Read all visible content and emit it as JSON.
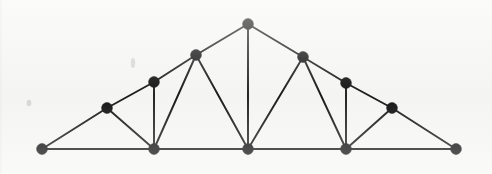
{
  "figure": {
    "width": 492,
    "height": 174,
    "background_color": "#f7f7f5",
    "node_color": "#141414",
    "edge_color": "#1a1a1a",
    "node_radius": 5.4,
    "edge_width": 1.9,
    "chord_width": 2.2
  },
  "chart_data": {
    "type": "scatter",
    "xlabel": "",
    "ylabel": "",
    "grid": false,
    "legend": null,
    "xlim": [
      0,
      492
    ],
    "ylim": [
      0,
      174
    ],
    "node_count": 13,
    "edge_count": 24,
    "nodes": [
      {
        "id": "n0",
        "label": "left-support",
        "x": 42,
        "y": 149
      },
      {
        "id": "n1",
        "label": "lower-left-chord",
        "x": 107,
        "y": 108
      },
      {
        "id": "n2",
        "label": "left-post-top",
        "x": 154,
        "y": 82
      },
      {
        "id": "n3",
        "label": "left-panel-joint",
        "x": 154,
        "y": 149
      },
      {
        "id": "n4",
        "label": "upper-left-chord",
        "x": 196,
        "y": 55
      },
      {
        "id": "n5",
        "label": "apex",
        "x": 248,
        "y": 24
      },
      {
        "id": "n6",
        "label": "center-joint",
        "x": 248,
        "y": 149
      },
      {
        "id": "n7",
        "label": "upper-right-chord",
        "x": 303,
        "y": 57
      },
      {
        "id": "n8",
        "label": "right-post-top",
        "x": 346,
        "y": 83
      },
      {
        "id": "n9",
        "label": "right-panel-joint",
        "x": 346,
        "y": 149
      },
      {
        "id": "n10",
        "label": "lower-right-chord",
        "x": 392,
        "y": 108
      },
      {
        "id": "n11",
        "label": "right-support",
        "x": 456,
        "y": 149
      }
    ],
    "edges": [
      {
        "from": "n0",
        "to": "n3",
        "kind": "chord"
      },
      {
        "from": "n3",
        "to": "n6",
        "kind": "chord"
      },
      {
        "from": "n6",
        "to": "n9",
        "kind": "chord"
      },
      {
        "from": "n9",
        "to": "n11",
        "kind": "chord"
      },
      {
        "from": "n0",
        "to": "n1",
        "kind": "member"
      },
      {
        "from": "n1",
        "to": "n2",
        "kind": "member"
      },
      {
        "from": "n2",
        "to": "n4",
        "kind": "member"
      },
      {
        "from": "n4",
        "to": "n5",
        "kind": "member"
      },
      {
        "from": "n5",
        "to": "n7",
        "kind": "member"
      },
      {
        "from": "n7",
        "to": "n8",
        "kind": "member"
      },
      {
        "from": "n8",
        "to": "n10",
        "kind": "member"
      },
      {
        "from": "n10",
        "to": "n11",
        "kind": "member"
      },
      {
        "from": "n1",
        "to": "n3",
        "kind": "member"
      },
      {
        "from": "n2",
        "to": "n3",
        "kind": "member"
      },
      {
        "from": "n3",
        "to": "n4",
        "kind": "member"
      },
      {
        "from": "n4",
        "to": "n6",
        "kind": "member"
      },
      {
        "from": "n5",
        "to": "n6",
        "kind": "member"
      },
      {
        "from": "n6",
        "to": "n7",
        "kind": "member"
      },
      {
        "from": "n7",
        "to": "n9",
        "kind": "member"
      },
      {
        "from": "n8",
        "to": "n9",
        "kind": "member"
      },
      {
        "from": "n9",
        "to": "n10",
        "kind": "member"
      }
    ]
  }
}
